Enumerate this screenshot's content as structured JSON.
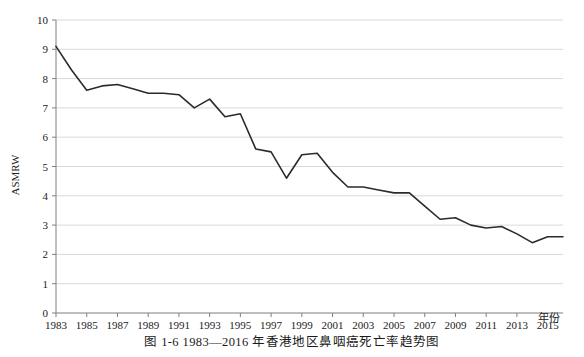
{
  "caption": "图 1-6    1983—2016 年香港地区鼻咽癌死亡率趋势图",
  "axis": {
    "ylabel": "ASMRW",
    "xlabel": "年份"
  },
  "chart_data": {
    "type": "line",
    "title": "",
    "subtitle": "",
    "xlabel": "年份",
    "ylabel": "ASMRW",
    "xlim": [
      1983,
      2016
    ],
    "ylim": [
      0,
      10
    ],
    "ytick_step": 1,
    "yticks": [
      0,
      1,
      2,
      3,
      4,
      5,
      6,
      7,
      8,
      9,
      10
    ],
    "xticks": [
      1983,
      1985,
      1987,
      1989,
      1991,
      1993,
      1995,
      1997,
      1999,
      2001,
      2003,
      2005,
      2007,
      2009,
      2011,
      2013,
      2015
    ],
    "xtick_labels": [
      "1983",
      "1985",
      "1987",
      "1989",
      "1991",
      "1993",
      "1995",
      "1997",
      "1999",
      "2001",
      "2003",
      "2005",
      "2007",
      "2009",
      "2011",
      "2013",
      "2015"
    ],
    "grid": "horizontal",
    "legend": "none",
    "line_color": "#2b2b2b",
    "grid_color": "#d9d9d9",
    "axis_color": "#808080",
    "x": [
      1983,
      1984,
      1985,
      1986,
      1987,
      1988,
      1989,
      1990,
      1991,
      1992,
      1993,
      1994,
      1995,
      1996,
      1997,
      1998,
      1999,
      2000,
      2001,
      2002,
      2003,
      2004,
      2005,
      2006,
      2007,
      2008,
      2009,
      2010,
      2011,
      2012,
      2013,
      2014,
      2015,
      2016
    ],
    "values": [
      9.1,
      8.3,
      7.6,
      7.75,
      7.8,
      7.65,
      7.5,
      7.5,
      7.45,
      7.0,
      7.3,
      6.7,
      6.8,
      5.6,
      5.5,
      4.6,
      5.4,
      5.45,
      4.8,
      4.3,
      4.3,
      4.2,
      4.1,
      4.1,
      3.65,
      3.2,
      3.25,
      3.0,
      2.9,
      2.95,
      2.7,
      2.4,
      2.6,
      2.6
    ],
    "series": [
      {
        "name": "ASMRW",
        "values": [
          9.1,
          8.3,
          7.6,
          7.75,
          7.8,
          7.65,
          7.5,
          7.5,
          7.45,
          7.0,
          7.3,
          6.7,
          6.8,
          5.6,
          5.5,
          4.6,
          5.4,
          5.45,
          4.8,
          4.3,
          4.3,
          4.2,
          4.1,
          4.1,
          3.65,
          3.2,
          3.25,
          3.0,
          2.9,
          2.95,
          2.7,
          2.4,
          2.6,
          2.6
        ]
      }
    ]
  }
}
